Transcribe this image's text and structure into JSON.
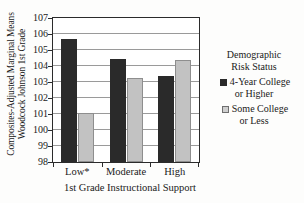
{
  "chart_data": {
    "type": "bar",
    "title": "",
    "xlabel": "1st Grade Instructional Support",
    "ylabel_line1": "Woodcock Johnson 1st Grade",
    "ylabel_line2": "Composites-Adjusted Marginal Means",
    "categories": [
      "Low*",
      "Moderate",
      "High"
    ],
    "series": [
      {
        "name": "4-Year College or Higher",
        "name_line1": "4-Year College",
        "name_line2": "or Higher",
        "color": "#2a2a2a",
        "values": [
          105.7,
          104.45,
          103.4
        ]
      },
      {
        "name": "Some College or Less",
        "name_line1": "Some College",
        "name_line2": "or Less",
        "color": "#c2c2c2",
        "values": [
          101.05,
          103.25,
          104.35
        ]
      }
    ],
    "ylim": [
      98,
      107
    ],
    "yticks": [
      98,
      99,
      100,
      101,
      102,
      103,
      104,
      105,
      106,
      107
    ],
    "ytick_labels": [
      "98",
      "99",
      "100",
      "101",
      "102",
      "103",
      "104",
      "105",
      "106",
      "107"
    ],
    "grid": true,
    "grid_axis": "y",
    "legend_position": "right"
  },
  "legend": {
    "title_line1": "Demographic",
    "title_line2": "Risk Status"
  }
}
